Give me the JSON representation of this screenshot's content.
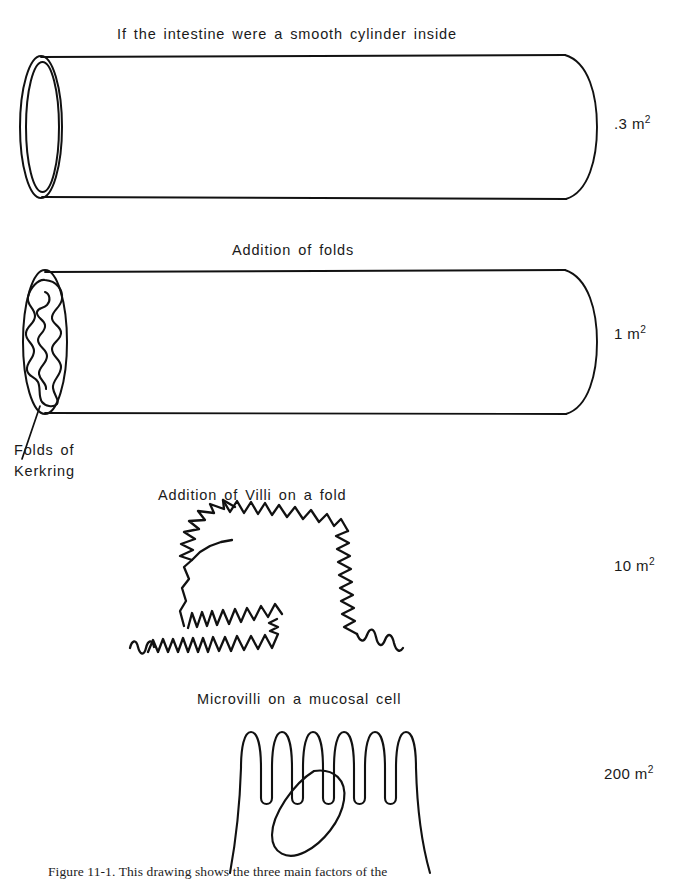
{
  "figure": {
    "title_alt": "Intestinal surface area amplification",
    "background_color": "#ffffff",
    "ink_color": "#111111",
    "caption_bottom": "Figure 11-1. This drawing shows the three main factors of the"
  },
  "stages": [
    {
      "id": "smooth-cylinder",
      "caption": "If the intestine were a smooth cylinder inside",
      "area": "​.3 m",
      "area_value": ".3",
      "area_unit": "m",
      "area_exponent": "2",
      "illustration": "smooth-cylinder-illustration"
    },
    {
      "id": "folds",
      "caption": "Addition of folds",
      "area_value": "1",
      "area_unit": "m",
      "area_exponent": "2",
      "illustration": "folded-cylinder-illustration",
      "annotation": {
        "line1": "Folds of",
        "line2": "Kerkring"
      }
    },
    {
      "id": "villi",
      "caption": "Addition of Villi on a fold",
      "area_value": "10",
      "area_unit": "m",
      "area_exponent": "2",
      "illustration": "villi-illustration"
    },
    {
      "id": "microvilli",
      "caption": "Microvilli on a mucosal cell",
      "area_value": "200",
      "area_unit": "m",
      "area_exponent": "2",
      "illustration": "microvilli-illustration"
    }
  ]
}
